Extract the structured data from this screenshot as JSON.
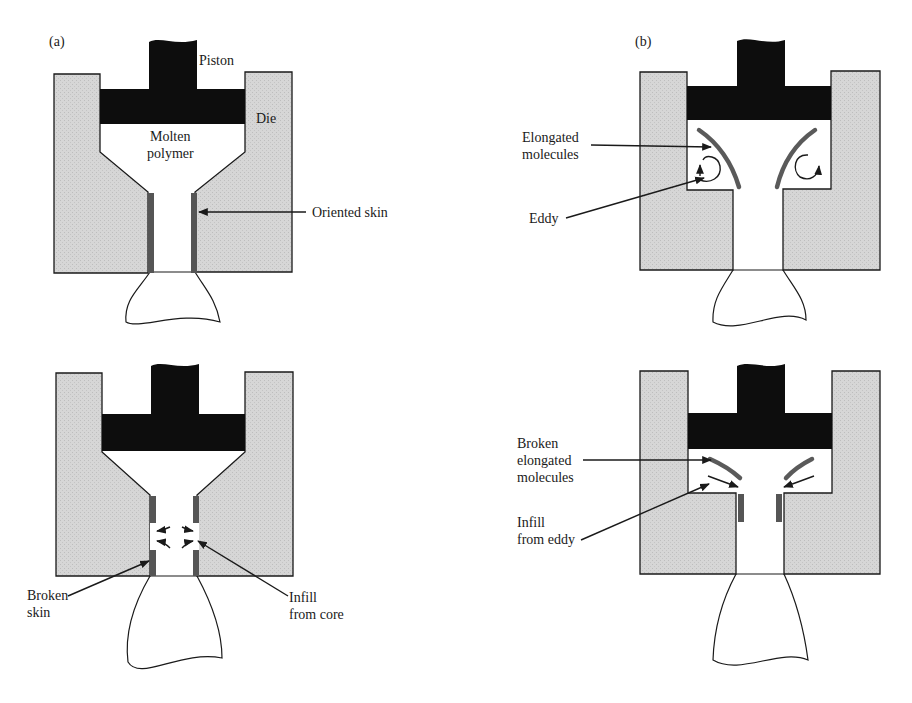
{
  "figure": {
    "colors": {
      "die_fill": "#d4d4d4",
      "piston_fill": "#0d0d0d",
      "skin_fill": "#555555",
      "molecule_stroke": "#5a5a5a",
      "line": "#1a1a1a"
    }
  },
  "panel_a": {
    "label": "(a)",
    "top": {
      "labels": {
        "piston": "Piston",
        "die": "Die",
        "molten_line1": "Molten",
        "molten_line2": "polymer",
        "oriented_skin": "Oriented skin"
      }
    },
    "bottom": {
      "labels": {
        "broken_skin_line1": "Broken",
        "broken_skin_line2": "skin",
        "infill_line1": "Infill",
        "infill_line2": "from core"
      }
    }
  },
  "panel_b": {
    "label": "(b)",
    "top": {
      "labels": {
        "elongated_line1": "Elongated",
        "elongated_line2": "molecules",
        "eddy": "Eddy"
      }
    },
    "bottom": {
      "labels": {
        "broken_line1": "Broken",
        "broken_line2": "elongated",
        "broken_line3": "molecules",
        "infill_line1": "Infill",
        "infill_line2": "from eddy"
      }
    }
  }
}
